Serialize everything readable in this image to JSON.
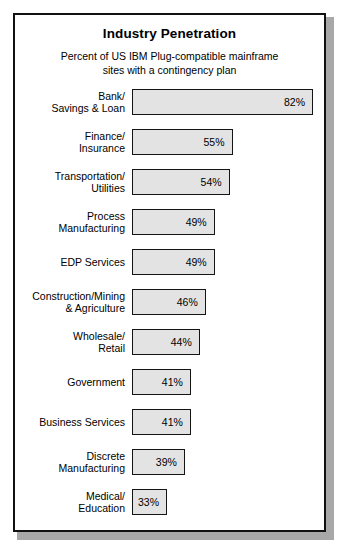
{
  "chart_data": {
    "type": "bar",
    "title": "Industry Penetration",
    "subtitle_line1": "Percent of US IBM Plug-compatible mainframe",
    "subtitle_line2": "sites with a contingency plan",
    "orientation": "horizontal",
    "xlabel": "",
    "ylabel": "",
    "grid": false,
    "legend": "none",
    "value_suffix": "%",
    "xlim": [
      0,
      100
    ],
    "categories": [
      "Bank/ Savings & Loan",
      "Finance/ Insurance",
      "Transportation/ Utilities",
      "Process Manufacturing",
      "EDP Services",
      "Construction/Mining & Agriculture",
      "Wholesale/ Retail",
      "Government",
      "Business Services",
      "Discrete Manufacturing",
      "Medical/ Education"
    ],
    "values": [
      82,
      55,
      54,
      49,
      49,
      46,
      44,
      41,
      41,
      39,
      33
    ],
    "bars": [
      {
        "label_line1": "Bank/",
        "label_line2": "Savings & Loan",
        "value": 82,
        "value_label": "82%"
      },
      {
        "label_line1": "Finance/",
        "label_line2": "Insurance",
        "value": 55,
        "value_label": "55%"
      },
      {
        "label_line1": "Transportation/",
        "label_line2": "Utilities",
        "value": 54,
        "value_label": "54%"
      },
      {
        "label_line1": "Process",
        "label_line2": "Manufacturing",
        "value": 49,
        "value_label": "49%"
      },
      {
        "label_line1": "EDP Services",
        "label_line2": "",
        "value": 49,
        "value_label": "49%"
      },
      {
        "label_line1": "Construction/Mining",
        "label_line2": "& Agriculture",
        "value": 46,
        "value_label": "46%"
      },
      {
        "label_line1": "Wholesale/",
        "label_line2": "Retail",
        "value": 44,
        "value_label": "44%"
      },
      {
        "label_line1": "Government",
        "label_line2": "",
        "value": 41,
        "value_label": "41%"
      },
      {
        "label_line1": "Business Services",
        "label_line2": "",
        "value": 41,
        "value_label": "41%"
      },
      {
        "label_line1": "Discrete",
        "label_line2": "Manufacturing",
        "value": 39,
        "value_label": "39%"
      },
      {
        "label_line1": "Medical/",
        "label_line2": "Education",
        "value": 33,
        "value_label": "33%"
      }
    ],
    "colors": {
      "bar_fill": "#e3e3e3",
      "bar_border": "#141414",
      "frame_border": "#111111",
      "background": "#ffffff",
      "text": "#000000",
      "shadow": "#a8a8a8"
    },
    "render": {
      "bar_origin_px": 117,
      "bar_min_width_px": 35,
      "px_per_percent": 2.98,
      "value_baseline_percent": 33
    }
  }
}
